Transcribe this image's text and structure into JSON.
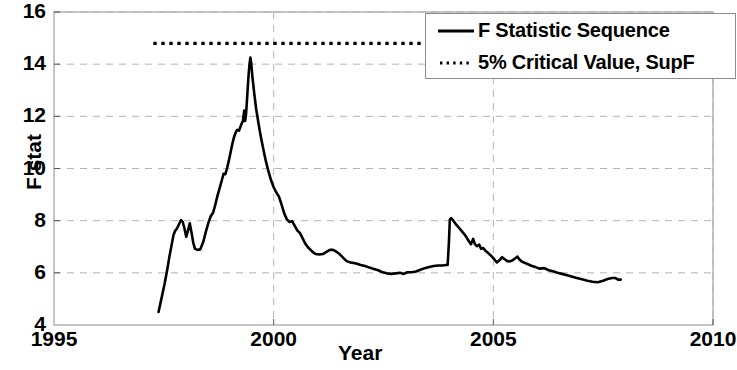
{
  "chart_data": {
    "type": "line",
    "title": "",
    "xlabel": "Year",
    "ylabel": "F stat",
    "xlim": [
      1995,
      2010
    ],
    "ylim": [
      4,
      16
    ],
    "xticks": [
      1995,
      2000,
      2005,
      2010
    ],
    "xticklabels": [
      "1995",
      "2000",
      "2005",
      "2010"
    ],
    "yticks": [
      4,
      6,
      8,
      10,
      12,
      14,
      16
    ],
    "yticklabels": [
      "4",
      "6",
      "8",
      "10",
      "12",
      "14",
      "16"
    ],
    "grid": true,
    "grid_style": "dashed",
    "grid_color": "#b4b4b4",
    "legend_position": "top-right",
    "series": [
      {
        "name": "F Statistic Sequence",
        "style": "solid",
        "color": "#000000",
        "width": 2.6,
        "points": [
          [
            1997.38,
            4.5
          ],
          [
            1997.45,
            5.05
          ],
          [
            1997.52,
            5.6
          ],
          [
            1997.58,
            6.15
          ],
          [
            1997.63,
            6.65
          ],
          [
            1997.68,
            7.1
          ],
          [
            1997.72,
            7.45
          ],
          [
            1997.76,
            7.62
          ],
          [
            1997.8,
            7.7
          ],
          [
            1997.85,
            7.88
          ],
          [
            1997.89,
            8.02
          ],
          [
            1997.93,
            7.95
          ],
          [
            1997.97,
            7.7
          ],
          [
            1998.01,
            7.38
          ],
          [
            1998.05,
            7.62
          ],
          [
            1998.09,
            7.9
          ],
          [
            1998.13,
            7.55
          ],
          [
            1998.17,
            7.15
          ],
          [
            1998.21,
            6.92
          ],
          [
            1998.27,
            6.88
          ],
          [
            1998.33,
            6.9
          ],
          [
            1998.4,
            7.2
          ],
          [
            1998.46,
            7.6
          ],
          [
            1998.52,
            7.95
          ],
          [
            1998.57,
            8.18
          ],
          [
            1998.62,
            8.3
          ],
          [
            1998.67,
            8.6
          ],
          [
            1998.72,
            8.95
          ],
          [
            1998.77,
            9.25
          ],
          [
            1998.82,
            9.55
          ],
          [
            1998.86,
            9.8
          ],
          [
            1998.9,
            9.78
          ],
          [
            1998.94,
            10.02
          ],
          [
            1998.98,
            10.3
          ],
          [
            1999.02,
            10.62
          ],
          [
            1999.06,
            10.95
          ],
          [
            1999.1,
            11.22
          ],
          [
            1999.14,
            11.4
          ],
          [
            1999.17,
            11.48
          ],
          [
            1999.21,
            11.45
          ],
          [
            1999.24,
            11.58
          ],
          [
            1999.27,
            11.72
          ],
          [
            1999.3,
            11.82
          ],
          [
            1999.33,
            12.22
          ],
          [
            1999.35,
            11.82
          ],
          [
            1999.37,
            12.05
          ],
          [
            1999.39,
            12.55
          ],
          [
            1999.41,
            13.1
          ],
          [
            1999.43,
            13.6
          ],
          [
            1999.45,
            14.0
          ],
          [
            1999.47,
            14.25
          ],
          [
            1999.49,
            14.02
          ],
          [
            1999.52,
            13.45
          ],
          [
            1999.56,
            12.85
          ],
          [
            1999.6,
            12.3
          ],
          [
            1999.65,
            11.78
          ],
          [
            1999.7,
            11.28
          ],
          [
            1999.76,
            10.78
          ],
          [
            1999.82,
            10.3
          ],
          [
            1999.88,
            9.9
          ],
          [
            1999.94,
            9.55
          ],
          [
            2000.0,
            9.28
          ],
          [
            2000.06,
            9.08
          ],
          [
            2000.12,
            8.92
          ],
          [
            2000.18,
            8.62
          ],
          [
            2000.24,
            8.28
          ],
          [
            2000.3,
            8.05
          ],
          [
            2000.36,
            7.95
          ],
          [
            2000.42,
            7.98
          ],
          [
            2000.48,
            7.8
          ],
          [
            2000.54,
            7.62
          ],
          [
            2000.6,
            7.52
          ],
          [
            2000.66,
            7.32
          ],
          [
            2000.72,
            7.12
          ],
          [
            2000.78,
            6.98
          ],
          [
            2000.84,
            6.88
          ],
          [
            2000.9,
            6.78
          ],
          [
            2000.96,
            6.72
          ],
          [
            2001.04,
            6.7
          ],
          [
            2001.12,
            6.72
          ],
          [
            2001.2,
            6.8
          ],
          [
            2001.28,
            6.88
          ],
          [
            2001.35,
            6.88
          ],
          [
            2001.42,
            6.82
          ],
          [
            2001.5,
            6.72
          ],
          [
            2001.58,
            6.58
          ],
          [
            2001.66,
            6.45
          ],
          [
            2001.74,
            6.4
          ],
          [
            2001.82,
            6.38
          ],
          [
            2001.9,
            6.35
          ],
          [
            2001.98,
            6.3
          ],
          [
            2002.08,
            6.26
          ],
          [
            2002.18,
            6.2
          ],
          [
            2002.28,
            6.15
          ],
          [
            2002.38,
            6.1
          ],
          [
            2002.48,
            6.02
          ],
          [
            2002.58,
            5.98
          ],
          [
            2002.68,
            5.96
          ],
          [
            2002.78,
            5.98
          ],
          [
            2002.88,
            6.0
          ],
          [
            2002.96,
            5.96
          ],
          [
            2003.04,
            6.02
          ],
          [
            2003.14,
            6.02
          ],
          [
            2003.24,
            6.05
          ],
          [
            2003.34,
            6.12
          ],
          [
            2003.44,
            6.18
          ],
          [
            2003.54,
            6.22
          ],
          [
            2003.64,
            6.26
          ],
          [
            2003.74,
            6.28
          ],
          [
            2003.84,
            6.28
          ],
          [
            2003.92,
            6.3
          ],
          [
            2003.96,
            6.3
          ],
          [
            2003.99,
            7.2
          ],
          [
            2004.01,
            8.05
          ],
          [
            2004.04,
            8.1
          ],
          [
            2004.09,
            8.0
          ],
          [
            2004.14,
            7.88
          ],
          [
            2004.19,
            7.78
          ],
          [
            2004.24,
            7.68
          ],
          [
            2004.29,
            7.58
          ],
          [
            2004.34,
            7.48
          ],
          [
            2004.39,
            7.36
          ],
          [
            2004.44,
            7.22
          ],
          [
            2004.49,
            7.1
          ],
          [
            2004.54,
            7.3
          ],
          [
            2004.58,
            7.1
          ],
          [
            2004.63,
            7.02
          ],
          [
            2004.68,
            7.08
          ],
          [
            2004.72,
            6.92
          ],
          [
            2004.77,
            6.95
          ],
          [
            2004.82,
            6.85
          ],
          [
            2004.87,
            6.78
          ],
          [
            2004.92,
            6.7
          ],
          [
            2004.97,
            6.62
          ],
          [
            2005.02,
            6.52
          ],
          [
            2005.08,
            6.4
          ],
          [
            2005.14,
            6.48
          ],
          [
            2005.2,
            6.6
          ],
          [
            2005.26,
            6.52
          ],
          [
            2005.32,
            6.45
          ],
          [
            2005.38,
            6.44
          ],
          [
            2005.44,
            6.48
          ],
          [
            2005.5,
            6.56
          ],
          [
            2005.55,
            6.62
          ],
          [
            2005.6,
            6.5
          ],
          [
            2005.66,
            6.42
          ],
          [
            2005.72,
            6.38
          ],
          [
            2005.8,
            6.32
          ],
          [
            2005.88,
            6.26
          ],
          [
            2005.96,
            6.22
          ],
          [
            2006.06,
            6.16
          ],
          [
            2006.16,
            6.18
          ],
          [
            2006.26,
            6.1
          ],
          [
            2006.36,
            6.06
          ],
          [
            2006.46,
            6.0
          ],
          [
            2006.56,
            5.96
          ],
          [
            2006.66,
            5.92
          ],
          [
            2006.78,
            5.86
          ],
          [
            2006.9,
            5.8
          ],
          [
            2007.02,
            5.75
          ],
          [
            2007.14,
            5.7
          ],
          [
            2007.26,
            5.66
          ],
          [
            2007.38,
            5.64
          ],
          [
            2007.5,
            5.7
          ],
          [
            2007.6,
            5.76
          ],
          [
            2007.7,
            5.8
          ],
          [
            2007.78,
            5.8
          ],
          [
            2007.84,
            5.74
          ],
          [
            2007.9,
            5.74
          ]
        ]
      }
    ],
    "reference_lines": [
      {
        "name": "5% Critical Value, SupF",
        "style": "dotted",
        "color": "#000000",
        "width": 3.2,
        "value": 14.8,
        "x_start": 1997.26,
        "x_end": 2009.6
      }
    ]
  },
  "axes": {
    "ylabel": "F stat",
    "xlabel": "Year",
    "yticks": [
      "16",
      "14",
      "12",
      "10",
      "8",
      "6",
      "4"
    ],
    "xticks": [
      "1995",
      "2000",
      "2005",
      "2010"
    ]
  },
  "legend": {
    "entries": [
      {
        "label": "F Statistic Sequence",
        "style": "solid"
      },
      {
        "label": "5% Critical Value, SupF",
        "style": "dotted"
      }
    ]
  }
}
